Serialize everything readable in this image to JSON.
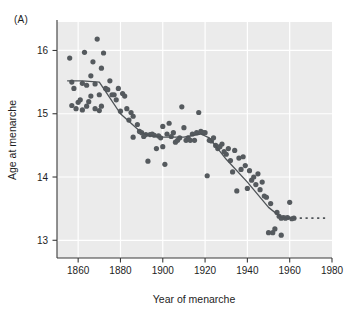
{
  "panel": {
    "label": "(A)"
  },
  "chart_data": {
    "type": "scatter",
    "title": "",
    "subtitle": "",
    "xlabel": "Year of menarche",
    "ylabel": "Age at menarche",
    "xlim": [
      1850,
      1980
    ],
    "ylim": [
      12.72,
      16.45
    ],
    "xticks": [
      1860,
      1880,
      1900,
      1920,
      1940,
      1960,
      1980
    ],
    "xtick_labels": [
      "1860",
      "1880",
      "1900",
      "1920",
      "1940",
      "1960",
      "1980"
    ],
    "yticks": [
      13,
      14,
      15,
      16
    ],
    "ytick_labels": [
      "13",
      "14",
      "15",
      "16"
    ],
    "grid": true,
    "grid_color": "#ffffff",
    "plot_background": "#ebebeb",
    "legend": null,
    "legend_position": "none",
    "point_color": "#555a5e",
    "point_radius": 2.6,
    "line_color": "#4f5458",
    "line_width": 1.3,
    "series": [
      {
        "name": "Age at menarche observations",
        "type": "scatter",
        "points": [
          [
            1856,
            15.88
          ],
          [
            1857,
            15.5
          ],
          [
            1857,
            15.13
          ],
          [
            1858,
            15.4
          ],
          [
            1859,
            15.08
          ],
          [
            1860,
            15.18
          ],
          [
            1861,
            15.22
          ],
          [
            1862,
            15.48
          ],
          [
            1862,
            15.06
          ],
          [
            1863,
            15.97
          ],
          [
            1864,
            15.45
          ],
          [
            1864,
            15.12
          ],
          [
            1865,
            15.19
          ],
          [
            1866,
            15.6
          ],
          [
            1866,
            15.28
          ],
          [
            1867,
            15.82
          ],
          [
            1868,
            15.47
          ],
          [
            1868,
            15.08
          ],
          [
            1869,
            16.18
          ],
          [
            1870,
            15.3
          ],
          [
            1870,
            15.05
          ],
          [
            1871,
            15.72
          ],
          [
            1871,
            15.12
          ],
          [
            1872,
            15.96
          ],
          [
            1873,
            15.4
          ],
          [
            1874,
            15.38
          ],
          [
            1875,
            15.52
          ],
          [
            1876,
            15.3
          ],
          [
            1877,
            15.3
          ],
          [
            1878,
            15.22
          ],
          [
            1879,
            15.4
          ],
          [
            1880,
            15.04
          ],
          [
            1881,
            15.32
          ],
          [
            1882,
            15.28
          ],
          [
            1883,
            15.08
          ],
          [
            1884,
            14.9
          ],
          [
            1885,
            15.02
          ],
          [
            1886,
            14.96
          ],
          [
            1886,
            14.63
          ],
          [
            1888,
            14.83
          ],
          [
            1889,
            14.72
          ],
          [
            1890,
            14.7
          ],
          [
            1891,
            14.64
          ],
          [
            1892,
            14.67
          ],
          [
            1893,
            14.25
          ],
          [
            1894,
            14.67
          ],
          [
            1895,
            14.68
          ],
          [
            1896,
            14.66
          ],
          [
            1897,
            14.45
          ],
          [
            1898,
            14.65
          ],
          [
            1899,
            14.62
          ],
          [
            1900,
            14.8
          ],
          [
            1900,
            14.48
          ],
          [
            1901,
            14.2
          ],
          [
            1902,
            14.68
          ],
          [
            1903,
            14.85
          ],
          [
            1904,
            14.64
          ],
          [
            1905,
            14.7
          ],
          [
            1906,
            14.55
          ],
          [
            1907,
            14.58
          ],
          [
            1908,
            14.62
          ],
          [
            1909,
            15.11
          ],
          [
            1910,
            14.78
          ],
          [
            1911,
            14.58
          ],
          [
            1912,
            14.62
          ],
          [
            1913,
            14.58
          ],
          [
            1914,
            14.68
          ],
          [
            1915,
            14.58
          ],
          [
            1916,
            14.7
          ],
          [
            1917,
            15.02
          ],
          [
            1918,
            14.72
          ],
          [
            1919,
            14.7
          ],
          [
            1920,
            14.7
          ],
          [
            1921,
            14.02
          ],
          [
            1922,
            14.58
          ],
          [
            1923,
            14.57
          ],
          [
            1924,
            14.62
          ],
          [
            1925,
            14.5
          ],
          [
            1926,
            14.45
          ],
          [
            1927,
            14.48
          ],
          [
            1928,
            14.52
          ],
          [
            1929,
            14.4
          ],
          [
            1930,
            14.36
          ],
          [
            1931,
            14.45
          ],
          [
            1932,
            14.26
          ],
          [
            1933,
            14.08
          ],
          [
            1934,
            14.42
          ],
          [
            1935,
            13.78
          ],
          [
            1936,
            14.3
          ],
          [
            1937,
            14.12
          ],
          [
            1938,
            14.32
          ],
          [
            1939,
            14.18
          ],
          [
            1940,
            13.82
          ],
          [
            1941,
            14.1
          ],
          [
            1942,
            13.95
          ],
          [
            1943,
            14.0
          ],
          [
            1944,
            13.88
          ],
          [
            1945,
            14.05
          ],
          [
            1946,
            13.8
          ],
          [
            1947,
            13.92
          ],
          [
            1948,
            13.7
          ],
          [
            1949,
            13.68
          ],
          [
            1950,
            13.12
          ],
          [
            1951,
            13.58
          ],
          [
            1952,
            13.12
          ],
          [
            1953,
            13.18
          ],
          [
            1954,
            13.44
          ],
          [
            1955,
            13.38
          ],
          [
            1956,
            13.35
          ],
          [
            1956,
            13.08
          ],
          [
            1957,
            13.36
          ],
          [
            1958,
            13.35
          ],
          [
            1959,
            13.36
          ],
          [
            1960,
            13.6
          ],
          [
            1961,
            13.34
          ],
          [
            1962,
            13.35
          ]
        ]
      },
      {
        "name": "Fitted trend (solid)",
        "type": "line",
        "style": "solid",
        "points": [
          [
            1855,
            15.52
          ],
          [
            1862,
            15.52
          ],
          [
            1870,
            15.5
          ],
          [
            1875,
            15.25
          ],
          [
            1880,
            15.0
          ],
          [
            1885,
            14.85
          ],
          [
            1890,
            14.7
          ],
          [
            1893,
            14.66
          ],
          [
            1900,
            14.63
          ],
          [
            1910,
            14.63
          ],
          [
            1918,
            14.68
          ],
          [
            1922,
            14.62
          ],
          [
            1930,
            14.28
          ],
          [
            1940,
            13.92
          ],
          [
            1950,
            13.52
          ],
          [
            1956,
            13.36
          ],
          [
            1959,
            13.35
          ],
          [
            1962,
            13.35
          ]
        ]
      },
      {
        "name": "Projected level (dashed)",
        "type": "line",
        "style": "dashed",
        "points": [
          [
            1962,
            13.35
          ],
          [
            1977,
            13.35
          ]
        ]
      }
    ]
  }
}
